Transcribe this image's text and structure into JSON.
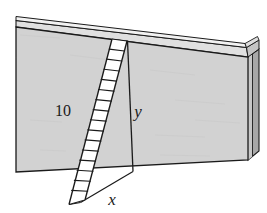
{
  "figure": {
    "labels": [
      {
        "id": "ladder-length",
        "text": "10",
        "style": "upright",
        "x": 63,
        "y": 116
      },
      {
        "id": "wall-height",
        "text": "y",
        "style": "italic",
        "x": 132,
        "y": 117
      },
      {
        "id": "ground-distance",
        "text": "x",
        "style": "italic",
        "x": 111,
        "y": 203
      }
    ],
    "colors": {
      "wall_face": "#d2d2d2",
      "wall_top_edge": "#e2e2e2",
      "wall_side_edge": "#9e9e9e",
      "wall_side_inner": "#bdbdbd",
      "outline": "#1a1a1a",
      "ladder_fill": "#ffffff",
      "background": "#ffffff"
    },
    "geometry": {
      "wall_face_points": "16,27 248,57 248,160 16,172",
      "wall_top_strip_points": "16,21 246,48 248,57 16,27",
      "wall_top_highlight_points": "16,18 245,44 246,48 16,21",
      "wall_side_points": "248,57 258,50 258,152 248,160",
      "wall_side_inner_points": "248,57 252,54 252,157 248,160",
      "ladder_top": {
        "rail_left_x": 112,
        "rail_left_y": 39,
        "rail_right_x": 127,
        "rail_right_y": 41
      },
      "ladder_bottom": {
        "rail_left_x": 69,
        "rail_left_y": 204,
        "rail_right_x": 85,
        "rail_right_y": 200
      },
      "rung_count": 15,
      "y_line": {
        "x1": 128,
        "y1": 41,
        "x2": 133,
        "y2": 172
      },
      "x_line": {
        "x1": 80,
        "y1": 203,
        "x2": 133,
        "y2": 172
      },
      "base_line": {
        "x1": 80,
        "y1": 203,
        "x2": 133,
        "y2": 172
      }
    }
  }
}
